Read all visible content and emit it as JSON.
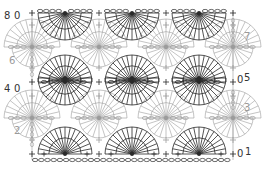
{
  "diagram": {
    "colors": {
      "dark": "#2a2a2a",
      "light": "#9c9c9c",
      "background": "#ffffff"
    },
    "bounds": {
      "left": 32,
      "right": 233
    },
    "row_labels": [
      {
        "text": "8",
        "x": 4,
        "y": 11,
        "side": "left",
        "tone": "dark"
      },
      {
        "text": "0",
        "x": 14,
        "y": 11,
        "side": "left",
        "tone": "dark"
      },
      {
        "text": "7",
        "x": 244,
        "y": 32,
        "side": "right",
        "tone": "light"
      },
      {
        "text": "6",
        "x": 9,
        "y": 56,
        "side": "left",
        "tone": "light"
      },
      {
        "text": "0",
        "x": 237,
        "y": 75,
        "side": "right",
        "tone": "dark"
      },
      {
        "text": "5",
        "x": 244,
        "y": 73,
        "side": "right",
        "tone": "dark"
      },
      {
        "text": "4",
        "x": 4,
        "y": 84,
        "side": "left",
        "tone": "dark"
      },
      {
        "text": "0",
        "x": 14,
        "y": 84,
        "side": "left",
        "tone": "dark"
      },
      {
        "text": "3",
        "x": 244,
        "y": 103,
        "side": "right",
        "tone": "light"
      },
      {
        "text": "2",
        "x": 14,
        "y": 126,
        "side": "left",
        "tone": "light"
      },
      {
        "text": "0",
        "x": 237,
        "y": 149,
        "side": "right",
        "tone": "dark"
      },
      {
        "text": "1",
        "x": 245,
        "y": 147,
        "side": "right",
        "tone": "dark"
      }
    ],
    "dark_fans": [
      {
        "cx": 65,
        "cy": 154,
        "dir": "up"
      },
      {
        "cx": 132,
        "cy": 154,
        "dir": "up"
      },
      {
        "cx": 199,
        "cy": 154,
        "dir": "up"
      },
      {
        "cx": 65,
        "cy": 82,
        "dir": "up"
      },
      {
        "cx": 132,
        "cy": 82,
        "dir": "up"
      },
      {
        "cx": 199,
        "cy": 82,
        "dir": "up"
      },
      {
        "cx": 65,
        "cy": 78,
        "dir": "down"
      },
      {
        "cx": 132,
        "cy": 78,
        "dir": "down"
      },
      {
        "cx": 199,
        "cy": 78,
        "dir": "down"
      },
      {
        "cx": 65,
        "cy": 13,
        "dir": "down"
      },
      {
        "cx": 132,
        "cy": 13,
        "dir": "down"
      },
      {
        "cx": 199,
        "cy": 13,
        "dir": "down"
      }
    ],
    "light_fans": [
      {
        "cx": 32,
        "cy": 118
      },
      {
        "cx": 99,
        "cy": 118
      },
      {
        "cx": 166,
        "cy": 118
      },
      {
        "cx": 233,
        "cy": 118
      },
      {
        "cx": 32,
        "cy": 47
      },
      {
        "cx": 99,
        "cy": 47
      },
      {
        "cx": 166,
        "cy": 47
      },
      {
        "cx": 233,
        "cy": 47
      }
    ],
    "chain_rows": [
      {
        "y": 160,
        "x1": 32,
        "x2": 233,
        "tone": "dark",
        "full": true
      },
      {
        "y": 118,
        "tone": "light",
        "full": false
      },
      {
        "y": 47,
        "tone": "light",
        "full": false
      },
      {
        "y": 13,
        "tone": "dark",
        "full": false
      },
      {
        "y": 85,
        "tone": "dark",
        "full": false
      }
    ],
    "legend_note": "Rows 1, 4-5, 8 dark; rows 2-3, 6-7 light"
  }
}
